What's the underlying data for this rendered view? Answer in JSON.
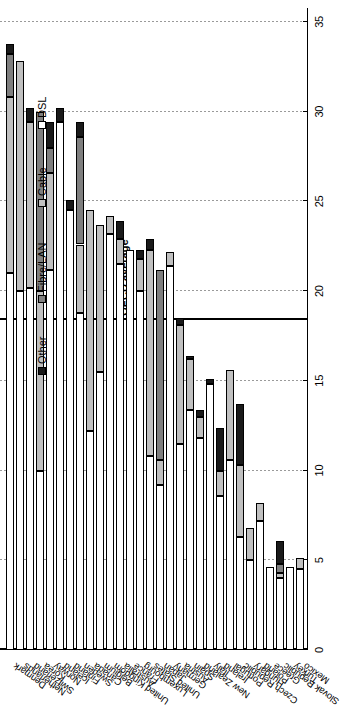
{
  "chart_data": {
    "type": "bar",
    "orientation": "horizontal-stacked",
    "title": "",
    "xlabel": "",
    "ylabel": "",
    "xlim": [
      0,
      35
    ],
    "xticks": [
      0,
      5,
      10,
      15,
      20,
      25,
      30,
      35
    ],
    "grid": true,
    "legend_position": "top-left",
    "annotations": [
      {
        "label": "OECD average",
        "value": 18.4,
        "type": "vline"
      }
    ],
    "series": [
      {
        "name": "DSL",
        "color": "#ffffff"
      },
      {
        "name": "Cable",
        "color": "#c0c0c0"
      },
      {
        "name": "Fibre/LAN",
        "color": "#7f7f7f"
      },
      {
        "name": "Other",
        "color": "#1a1a1a"
      }
    ],
    "categories": [
      "Denmark",
      "Netherlands",
      "Switzerland",
      "Korea",
      "Norway",
      "Iceland",
      "Finland",
      "Sweden",
      "Canada",
      "Belgium",
      "United Kingdom",
      "Australia",
      "France",
      "Luxembourg",
      "United States",
      "Japan",
      "Germany",
      "Austria",
      "Spain",
      "New Zealand",
      "Italy",
      "Ireland",
      "Portugal",
      "Czech Republic",
      "Hungary",
      "Poland",
      "Greece",
      "Slovak Republic",
      "Turkey",
      "Mexico"
    ],
    "values": {
      "DSL": [
        21.0,
        20.0,
        20.2,
        10.0,
        21.2,
        29.4,
        24.5,
        18.8,
        12.2,
        15.5,
        23.2,
        21.5,
        22.3,
        20.0,
        10.8,
        9.2,
        21.4,
        11.5,
        13.4,
        11.8,
        14.8,
        8.6,
        10.6,
        6.3,
        5.0,
        7.2,
        4.6,
        4.0,
        4.6,
        4.5
      ],
      "Cable": [
        9.8,
        12.8,
        9.2,
        10.0,
        5.4,
        0.0,
        0.0,
        3.8,
        12.3,
        8.2,
        1.0,
        1.4,
        0.0,
        1.8,
        11.5,
        1.4,
        0.8,
        6.6,
        2.8,
        1.2,
        0.0,
        1.4,
        5.0,
        4.0,
        1.8,
        1.0,
        0.0,
        0.3,
        0.0,
        0.6
      ],
      "Fibre/LAN": [
        2.4,
        0.0,
        0.0,
        10.0,
        1.4,
        0.0,
        0.0,
        6.0,
        0.0,
        0.0,
        0.0,
        0.0,
        0.0,
        0.0,
        0.0,
        10.6,
        0.0,
        0.0,
        0.0,
        0.0,
        0.0,
        0.0,
        0.0,
        0.0,
        0.0,
        0.0,
        0.0,
        0.5,
        0.0,
        0.0
      ],
      "Other": [
        0.6,
        0.0,
        0.8,
        0.0,
        1.4,
        0.8,
        0.6,
        0.8,
        0.0,
        0.0,
        0.0,
        1.0,
        0.0,
        0.5,
        0.6,
        0.0,
        0.0,
        0.4,
        0.2,
        0.4,
        0.3,
        2.4,
        0.0,
        3.4,
        0.0,
        0.0,
        0.0,
        1.3,
        0.0,
        0.0
      ]
    },
    "totals": [
      33.8,
      32.8,
      30.2,
      30.0,
      29.4,
      30.2,
      25.1,
      29.4,
      24.5,
      23.7,
      24.2,
      23.9,
      22.3,
      22.3,
      22.9,
      21.2,
      22.2,
      18.5,
      16.4,
      13.4,
      15.1,
      12.4,
      15.6,
      13.7,
      6.8,
      8.2,
      4.6,
      6.1,
      4.6,
      5.1
    ]
  },
  "legend": {
    "items": [
      {
        "label": "Other",
        "color": "#1a1a1a"
      },
      {
        "label": "Fibre/LAN",
        "color": "#7f7f7f"
      },
      {
        "label": "Cable",
        "color": "#c0c0c0"
      },
      {
        "label": "DSL",
        "color": "#ffffff"
      }
    ]
  }
}
